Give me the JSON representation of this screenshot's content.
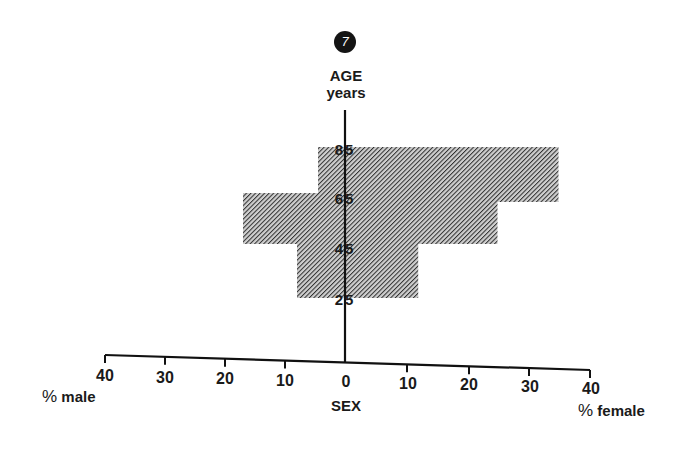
{
  "figure": {
    "badge_number": "7",
    "y_axis_title_line1": "AGE",
    "y_axis_title_line2": "years",
    "x_axis_title": "SEX",
    "left_label_pct": "%",
    "left_label_word": "male",
    "right_label_pct": "%",
    "right_label_word": "female",
    "x_tick_labels_left": [
      "40",
      "30",
      "20",
      "10"
    ],
    "x_tick_label_center": "0",
    "x_tick_labels_right": [
      "10",
      "20",
      "30",
      "40"
    ],
    "age_labels": [
      "85",
      "65",
      "45",
      "25"
    ],
    "colors": {
      "ink": "#1a1a1a",
      "hatch": "#3a3a3a",
      "background": "#ffffff"
    }
  },
  "chart_data": {
    "type": "bar",
    "subtype": "population-pyramid",
    "title": "",
    "badge": "7",
    "ylabel": "AGE years",
    "xlabel": "SEX",
    "x_left_label": "% male",
    "x_right_label": "% female",
    "categories": [
      "25-45",
      "45-65",
      "65-85"
    ],
    "age_tick_labels": [
      "25",
      "45",
      "65",
      "85"
    ],
    "series": [
      {
        "name": "% male",
        "values": [
          8,
          17,
          4.5
        ]
      },
      {
        "name": "% female",
        "values": [
          12,
          25,
          35
        ]
      }
    ],
    "xlim": [
      -40,
      40
    ],
    "x_ticks": [
      40,
      30,
      20,
      10,
      0,
      10,
      20,
      30,
      40
    ],
    "grid": false,
    "legend": "none",
    "fill": "diagonal hatch"
  }
}
